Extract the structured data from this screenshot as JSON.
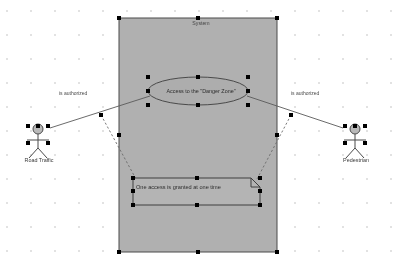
{
  "diagram": {
    "kind": "uml-use-case-diagram",
    "canvas": {
      "width": 402,
      "height": 270,
      "background": "#ffffff",
      "grid_color": "#e2e2e2"
    },
    "system_boundary": {
      "label": "System",
      "fill": "#b0b0b0",
      "stroke": "#4a4a4a",
      "x": 119,
      "y": 18,
      "width": 158,
      "height": 234,
      "selected": true
    },
    "use_case": {
      "label": "Access to the \"Danger Zone\"",
      "fill": "#adadad",
      "stroke": "#4a4a4a",
      "cx": 198,
      "cy": 91,
      "rx": 50,
      "ry": 14,
      "selected": true
    },
    "note": {
      "text": "One access is granted at one time",
      "fill": "#b4b4b4",
      "stroke": "#3f3f3f",
      "x": 133,
      "y": 178,
      "width": 127,
      "height": 27,
      "fold_size": 9,
      "selected": true
    },
    "actors": [
      {
        "name": "Road Traffic",
        "side": "left",
        "cx": 38,
        "head_cy": 129,
        "head_fill": "#b9b9b9",
        "stroke": "#4a4a4a",
        "selected": true
      },
      {
        "name": "Pedestrian",
        "side": "right",
        "cx": 355,
        "head_cy": 129,
        "head_fill": "#b9b9b9",
        "stroke": "#4a4a4a",
        "selected": true
      }
    ],
    "associations": [
      {
        "label": "is authorized",
        "from": "Road Traffic",
        "to": "Access to the \"Danger Zone\"",
        "style": "solid",
        "stroke": "#5a5a5a"
      },
      {
        "label": "is authorized",
        "from": "Pedestrian",
        "to": "Access to the \"Danger Zone\"",
        "style": "solid",
        "stroke": "#5a5a5a"
      }
    ],
    "note_links": [
      {
        "style": "dashed",
        "stroke": "#6a6a6a",
        "from_x": 101,
        "from_y": 115,
        "to_x": 133,
        "to_y": 178
      },
      {
        "style": "dashed",
        "stroke": "#6a6a6a",
        "from_x": 291,
        "from_y": 115,
        "to_x": 260,
        "to_y": 178
      }
    ],
    "selection_handles": {
      "color": "#000000",
      "size": 4
    }
  }
}
